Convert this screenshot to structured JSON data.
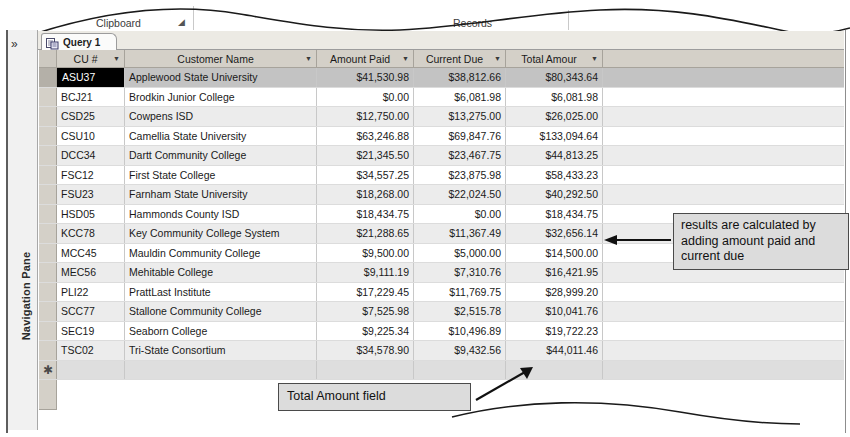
{
  "ribbon": {
    "groups": [
      {
        "label": "Clipboard",
        "x": 96
      },
      {
        "label": "Records",
        "x": 453
      }
    ],
    "dialog_launcher_icon": "dialog-launcher-icon"
  },
  "navigation_pane": {
    "label": "Navigation Pane",
    "expand_icon": "»"
  },
  "tab": {
    "label": "Query 1",
    "icon": "query-icon"
  },
  "datasheet": {
    "columns": [
      {
        "key": "cu",
        "label": "CU #"
      },
      {
        "key": "name",
        "label": "Customer Name"
      },
      {
        "key": "paid",
        "label": "Amount Paid"
      },
      {
        "key": "due",
        "label": "Current Due"
      },
      {
        "key": "total",
        "label": "Total Amour"
      }
    ],
    "rows": [
      {
        "cu": "ASU37",
        "name": "Applewood State University",
        "paid": "$41,530.98",
        "due": "$38,812.66",
        "total": "$80,343.64"
      },
      {
        "cu": "BCJ21",
        "name": "Brodkin Junior College",
        "paid": "$0.00",
        "due": "$6,081.98",
        "total": "$6,081.98"
      },
      {
        "cu": "CSD25",
        "name": "Cowpens ISD",
        "paid": "$12,750.00",
        "due": "$13,275.00",
        "total": "$26,025.00"
      },
      {
        "cu": "CSU10",
        "name": "Camellia State University",
        "paid": "$63,246.88",
        "due": "$69,847.76",
        "total": "$133,094.64"
      },
      {
        "cu": "DCC34",
        "name": "Dartt Community College",
        "paid": "$21,345.50",
        "due": "$23,467.75",
        "total": "$44,813.25"
      },
      {
        "cu": "FSC12",
        "name": "First State College",
        "paid": "$34,557.25",
        "due": "$23,875.98",
        "total": "$58,433.23"
      },
      {
        "cu": "FSU23",
        "name": "Farnham State University",
        "paid": "$18,268.00",
        "due": "$22,024.50",
        "total": "$40,292.50"
      },
      {
        "cu": "HSD05",
        "name": "Hammonds County ISD",
        "paid": "$18,434.75",
        "due": "$0.00",
        "total": "$18,434.75"
      },
      {
        "cu": "KCC78",
        "name": "Key Community College System",
        "paid": "$21,288.65",
        "due": "$11,367.49",
        "total": "$32,656.14"
      },
      {
        "cu": "MCC45",
        "name": "Mauldin Community College",
        "paid": "$9,500.00",
        "due": "$5,000.00",
        "total": "$14,500.00"
      },
      {
        "cu": "MEC56",
        "name": "Mehitable College",
        "paid": "$9,111.19",
        "due": "$7,310.76",
        "total": "$16,421.95"
      },
      {
        "cu": "PLI22",
        "name": "PrattLast Institute",
        "paid": "$17,229.45",
        "due": "$11,769.75",
        "total": "$28,999.20"
      },
      {
        "cu": "SCC77",
        "name": "Stallone Community College",
        "paid": "$7,525.98",
        "due": "$2,515.78",
        "total": "$10,041.76"
      },
      {
        "cu": "SEC19",
        "name": "Seaborn College",
        "paid": "$9,225.34",
        "due": "$10,496.89",
        "total": "$19,722.23"
      },
      {
        "cu": "TSC02",
        "name": "Tri-State Consortium",
        "paid": "$34,578.90",
        "due": "$9,432.56",
        "total": "$44,011.46"
      }
    ],
    "selected_row_index": 0,
    "selected_cell": "cu",
    "new_record_marker": "✱"
  },
  "annotations": [
    {
      "id": "results",
      "text": "results are calculated by adding amount paid and current due"
    },
    {
      "id": "total",
      "text": "Total Amount field"
    }
  ],
  "colors": {
    "header_bg": "#d4d0c8",
    "alt_row_bg": "#ececec",
    "selected_row_bg": "#c3c3c3",
    "callout_bg": "#dcdcdc",
    "callout_border": "#4a4a4a"
  }
}
